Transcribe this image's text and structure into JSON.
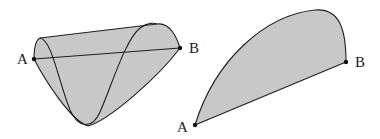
{
  "figures": [
    {
      "id": "left",
      "description": "3D surface bounded by a sinusoidal curve on a cylinder, with straight chord AB",
      "labels": {
        "start": "A",
        "end": "B"
      }
    },
    {
      "id": "right",
      "description": "2D shaded region bounded by a convex arc and the straight segment from A to B",
      "labels": {
        "start": "A",
        "end": "B"
      }
    }
  ],
  "colors": {
    "fill": "#c8c8c8",
    "stroke": "#1e1e1e",
    "background": "#ffffff"
  }
}
